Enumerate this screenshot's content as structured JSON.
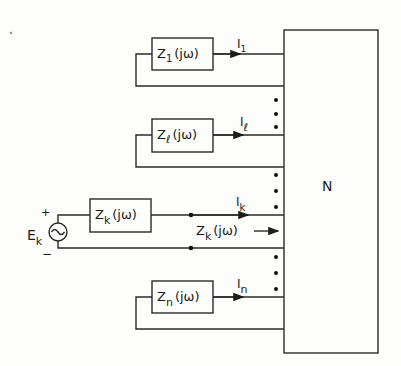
{
  "diagram": {
    "network_label": "N",
    "ports": [
      {
        "impedance_main": "Z",
        "impedance_sub": "1",
        "impedance_arg": "(jω)",
        "current_main": "I",
        "current_sub": "1"
      },
      {
        "impedance_main": "Z",
        "impedance_sub": "ℓ",
        "impedance_arg": "(jω)",
        "current_main": "I",
        "current_sub": "ℓ"
      },
      {
        "impedance_main": "Z",
        "impedance_sub": "k",
        "impedance_arg": "(jω)",
        "current_main": "I",
        "current_sub": "k"
      },
      {
        "impedance_main": "Z",
        "impedance_sub": "n",
        "impedance_arg": "(jω)",
        "current_main": "I",
        "current_sub": "n"
      }
    ],
    "source": {
      "main": "E",
      "sub": "k",
      "plus": "+",
      "minus": "−",
      "symbol": "ac-source"
    },
    "input_impedance": {
      "main": "Z",
      "sub": "k",
      "arg": "(jω)",
      "arrow": "→"
    }
  }
}
